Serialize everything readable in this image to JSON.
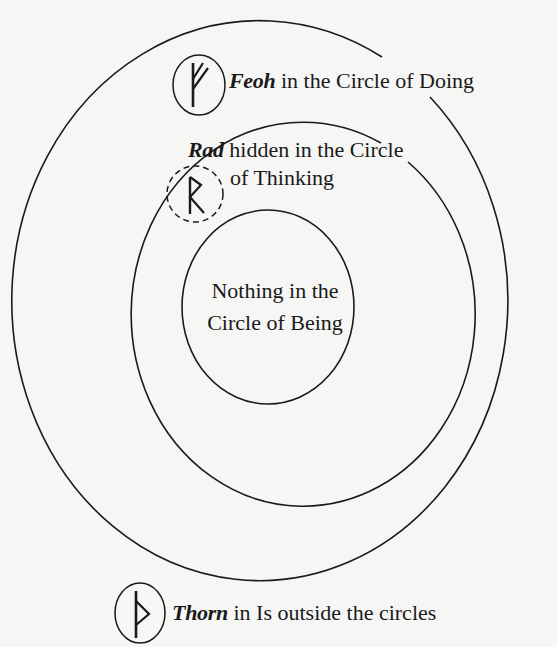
{
  "diagram": {
    "circles": [
      {
        "id": "outer",
        "name": "Circle of Doing"
      },
      {
        "id": "middle",
        "name": "Circle of Thinking"
      },
      {
        "id": "inner",
        "name": "Circle of Being"
      }
    ],
    "runes": [
      {
        "id": "feoh",
        "name": "Feoh",
        "glyph": "ᚠ",
        "style": "solid"
      },
      {
        "id": "rad",
        "name": "Rad",
        "glyph": "ᚱ",
        "style": "dashed"
      },
      {
        "id": "thorn",
        "name": "Thorn",
        "glyph": "ᚦ",
        "style": "solid"
      }
    ],
    "labels": {
      "feoh": {
        "rune": "Feoh",
        "text": " in the Circle of Doing"
      },
      "rad": {
        "rune": "Rad",
        "text_line1": " hidden in the Circle",
        "text_line2": "of Thinking"
      },
      "nothing": {
        "line1": "Nothing in the",
        "line2": "Circle of Being"
      },
      "thorn": {
        "rune": "Thorn",
        "text": " in Is outside the circles"
      }
    },
    "colors": {
      "ink": "#1a1a1a",
      "paper": "#f6f6f5"
    }
  }
}
